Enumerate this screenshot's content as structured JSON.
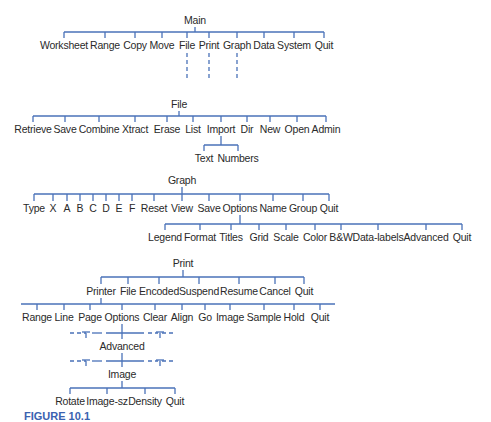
{
  "colors": {
    "line": "#4a72b8",
    "text": "#2a2a2a",
    "caption_label": "#3a62b0"
  },
  "trees": {
    "main": {
      "root": {
        "label": "Main",
        "x": 195,
        "y": 14
      },
      "bar_y": 32,
      "children": [
        {
          "label": "Worksheet",
          "x": 64
        },
        {
          "label": "Range",
          "x": 105
        },
        {
          "label": "Copy",
          "x": 135
        },
        {
          "label": "Move",
          "x": 162
        },
        {
          "label": "File",
          "x": 187
        },
        {
          "label": "Print",
          "x": 209
        },
        {
          "label": "Graph",
          "x": 237
        },
        {
          "label": "Data",
          "x": 264
        },
        {
          "label": "System",
          "x": 294
        },
        {
          "label": "Quit",
          "x": 324
        }
      ],
      "label_y": 39,
      "dashed_from": [
        "File",
        "Print",
        "Graph"
      ]
    },
    "file": {
      "root": {
        "label": "File",
        "x": 179,
        "y": 98
      },
      "bar_y": 116,
      "children": [
        {
          "label": "Retrieve",
          "x": 33
        },
        {
          "label": "Save",
          "x": 65
        },
        {
          "label": "Combine",
          "x": 99
        },
        {
          "label": "Xtract",
          "x": 135
        },
        {
          "label": "Erase",
          "x": 167
        },
        {
          "label": "List",
          "x": 193
        },
        {
          "label": "Import",
          "x": 221
        },
        {
          "label": "Dir",
          "x": 247
        },
        {
          "label": "New",
          "x": 270
        },
        {
          "label": "Open",
          "x": 297
        },
        {
          "label": "Admin",
          "x": 326
        }
      ],
      "label_y": 123,
      "sub": {
        "parent": "Import",
        "bar_y": 145,
        "children": [
          {
            "label": "Text",
            "x": 204
          },
          {
            "label": "Numbers",
            "x": 238
          }
        ],
        "label_y": 152
      }
    },
    "graph": {
      "root": {
        "label": "Graph",
        "x": 182,
        "y": 174
      },
      "bar_y": 194,
      "children": [
        {
          "label": "Type",
          "x": 34
        },
        {
          "label": "X",
          "x": 53
        },
        {
          "label": "A",
          "x": 67
        },
        {
          "label": "B",
          "x": 80
        },
        {
          "label": "C",
          "x": 93
        },
        {
          "label": "D",
          "x": 106
        },
        {
          "label": "E",
          "x": 119
        },
        {
          "label": "F",
          "x": 132
        },
        {
          "label": "Reset",
          "x": 154
        },
        {
          "label": "View",
          "x": 182
        },
        {
          "label": "Save",
          "x": 209
        },
        {
          "label": "Options",
          "x": 240
        },
        {
          "label": "Name",
          "x": 273
        },
        {
          "label": "Group",
          "x": 303
        },
        {
          "label": "Quit",
          "x": 329
        }
      ],
      "label_y": 202,
      "sub": {
        "parent": "Options",
        "bar_y": 224,
        "children": [
          {
            "label": "Legend",
            "x": 165
          },
          {
            "label": "Format",
            "x": 200
          },
          {
            "label": "Titles",
            "x": 231
          },
          {
            "label": "Grid",
            "x": 259
          },
          {
            "label": "Scale",
            "x": 286
          },
          {
            "label": "Color",
            "x": 315
          },
          {
            "label": "B&W",
            "x": 341
          },
          {
            "label": "Data-labels",
            "x": 378
          },
          {
            "label": "Advanced",
            "x": 426
          },
          {
            "label": "Quit",
            "x": 462
          }
        ],
        "label_y": 231
      }
    },
    "print": {
      "root": {
        "label": "Print",
        "x": 183,
        "y": 257
      },
      "bar_y": 277,
      "children": [
        {
          "label": "Printer",
          "x": 101
        },
        {
          "label": "File",
          "x": 128
        },
        {
          "label": "Encoded",
          "x": 159
        },
        {
          "label": "Suspend",
          "x": 199
        },
        {
          "label": "Resume",
          "x": 239
        },
        {
          "label": "Cancel",
          "x": 275
        },
        {
          "label": "Quit",
          "x": 304
        }
      ],
      "label_y": 285,
      "sub": {
        "parent": "Printer",
        "bar_y": 304,
        "bar_x1": 21,
        "bar_x2": 335,
        "children": [
          {
            "label": "Range",
            "x": 37
          },
          {
            "label": "Line",
            "x": 64
          },
          {
            "label": "Page",
            "x": 90
          },
          {
            "label": "Options",
            "x": 122
          },
          {
            "label": "Clear",
            "x": 155
          },
          {
            "label": "Align",
            "x": 182
          },
          {
            "label": "Go",
            "x": 205
          },
          {
            "label": "Image",
            "x": 230
          },
          {
            "label": "Sample",
            "x": 264
          },
          {
            "label": "Hold",
            "x": 294
          },
          {
            "label": "Quit",
            "x": 320
          }
        ],
        "label_y": 311
      },
      "advanced": {
        "label": "Advanced",
        "x": 122,
        "y": 340,
        "dash_y": 333
      },
      "image": {
        "label": "Image",
        "x": 122,
        "y": 368,
        "dash_y": 361
      },
      "image_sub": {
        "bar_y": 388,
        "children": [
          {
            "label": "Rotate",
            "x": 70
          },
          {
            "label": "Image-sz",
            "x": 107
          },
          {
            "label": "Density",
            "x": 145
          },
          {
            "label": "Quit",
            "x": 175
          }
        ],
        "label_y": 395
      }
    }
  },
  "caption": {
    "figure_label": "FIGURE 10.1",
    "text": "Menu tree of a spreadsheet program (partial, clipped at image edge)"
  }
}
